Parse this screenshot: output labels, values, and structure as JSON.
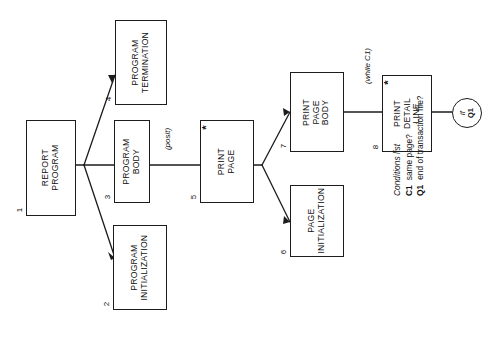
{
  "diagram": {
    "orientation": "rotated-90-ccw",
    "line_color": "#1c1c1c",
    "background_color": "#ffffff",
    "nodes": [
      {
        "id": "1",
        "number": "1",
        "lines": [
          "REPORT",
          "PROGRAM"
        ],
        "marker": ""
      },
      {
        "id": "2",
        "number": "2",
        "lines": [
          "PROGRAM",
          "INITIALIZATION"
        ],
        "marker": ""
      },
      {
        "id": "3",
        "number": "3",
        "lines": [
          "PROGRAM",
          "BODY"
        ],
        "marker": ""
      },
      {
        "id": "4",
        "number": "4",
        "lines": [
          "PROGRAM",
          "TERMINATION"
        ],
        "marker": ""
      },
      {
        "id": "5",
        "number": "5",
        "lines": [
          "PRINT",
          "PAGE"
        ],
        "marker": "*"
      },
      {
        "id": "6",
        "number": "6",
        "lines": [
          "PAGE",
          "INITIALIZATION"
        ],
        "marker": ""
      },
      {
        "id": "7",
        "number": "7",
        "lines": [
          "PRINT",
          "PAGE",
          "BODY"
        ],
        "marker": ""
      },
      {
        "id": "8",
        "number": "8",
        "lines": [
          "PRINT",
          "DETAIL",
          "LINE"
        ],
        "marker": "*"
      }
    ],
    "edge_labels": [
      {
        "id": "posit",
        "text": "(posit)"
      },
      {
        "id": "while-c1",
        "text": "(while C1)"
      }
    ],
    "terminal": {
      "id": "if-q1",
      "prefix": "if",
      "condition": "Q1"
    },
    "conditions": {
      "title": "Conditions list",
      "items": [
        {
          "code": "C1",
          "text": "same page?"
        },
        {
          "code": "Q1",
          "text": "end of transaction file?"
        }
      ]
    }
  }
}
